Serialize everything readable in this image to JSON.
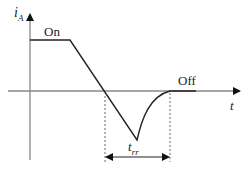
{
  "diagram": {
    "y_axis_label": "i",
    "y_axis_subscript": "A",
    "x_axis_label": "t",
    "state_on_label": "On",
    "state_off_label": "Off",
    "recovery_time_label": "t",
    "recovery_time_subscript": "rr",
    "colors": {
      "axis": "#888888",
      "curve": "#222222",
      "dashed": "#555555",
      "text": "#222222"
    }
  }
}
